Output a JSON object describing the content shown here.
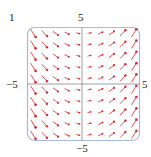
{
  "figure": {
    "panel_label": "1",
    "axis_labels": {
      "top": "5",
      "bottom": "−5",
      "left": "−5",
      "right": "5"
    },
    "colors": {
      "arrow": "#e8504f",
      "arrow_head": "#c8303a",
      "frame": "#a9b9d9",
      "axis": "#888888"
    }
  },
  "chart_data": {
    "type": "vector_field",
    "title": "",
    "xlim": [
      -5,
      5
    ],
    "ylim": [
      -5,
      5
    ],
    "grid": false,
    "x_ticks": [
      "−5",
      "5"
    ],
    "y_ticks": [
      "−5",
      "5"
    ],
    "columns": 10,
    "rows": 10,
    "field_x_positions": [
      -4.5,
      -3.5,
      -2.5,
      -1.5,
      -0.5,
      0.5,
      1.5,
      2.5,
      3.5,
      4.5
    ],
    "field_y_positions": [
      4.5,
      3.5,
      2.5,
      1.5,
      0.5,
      -0.5,
      -1.5,
      -2.5,
      -3.5,
      -4.5
    ]
  }
}
